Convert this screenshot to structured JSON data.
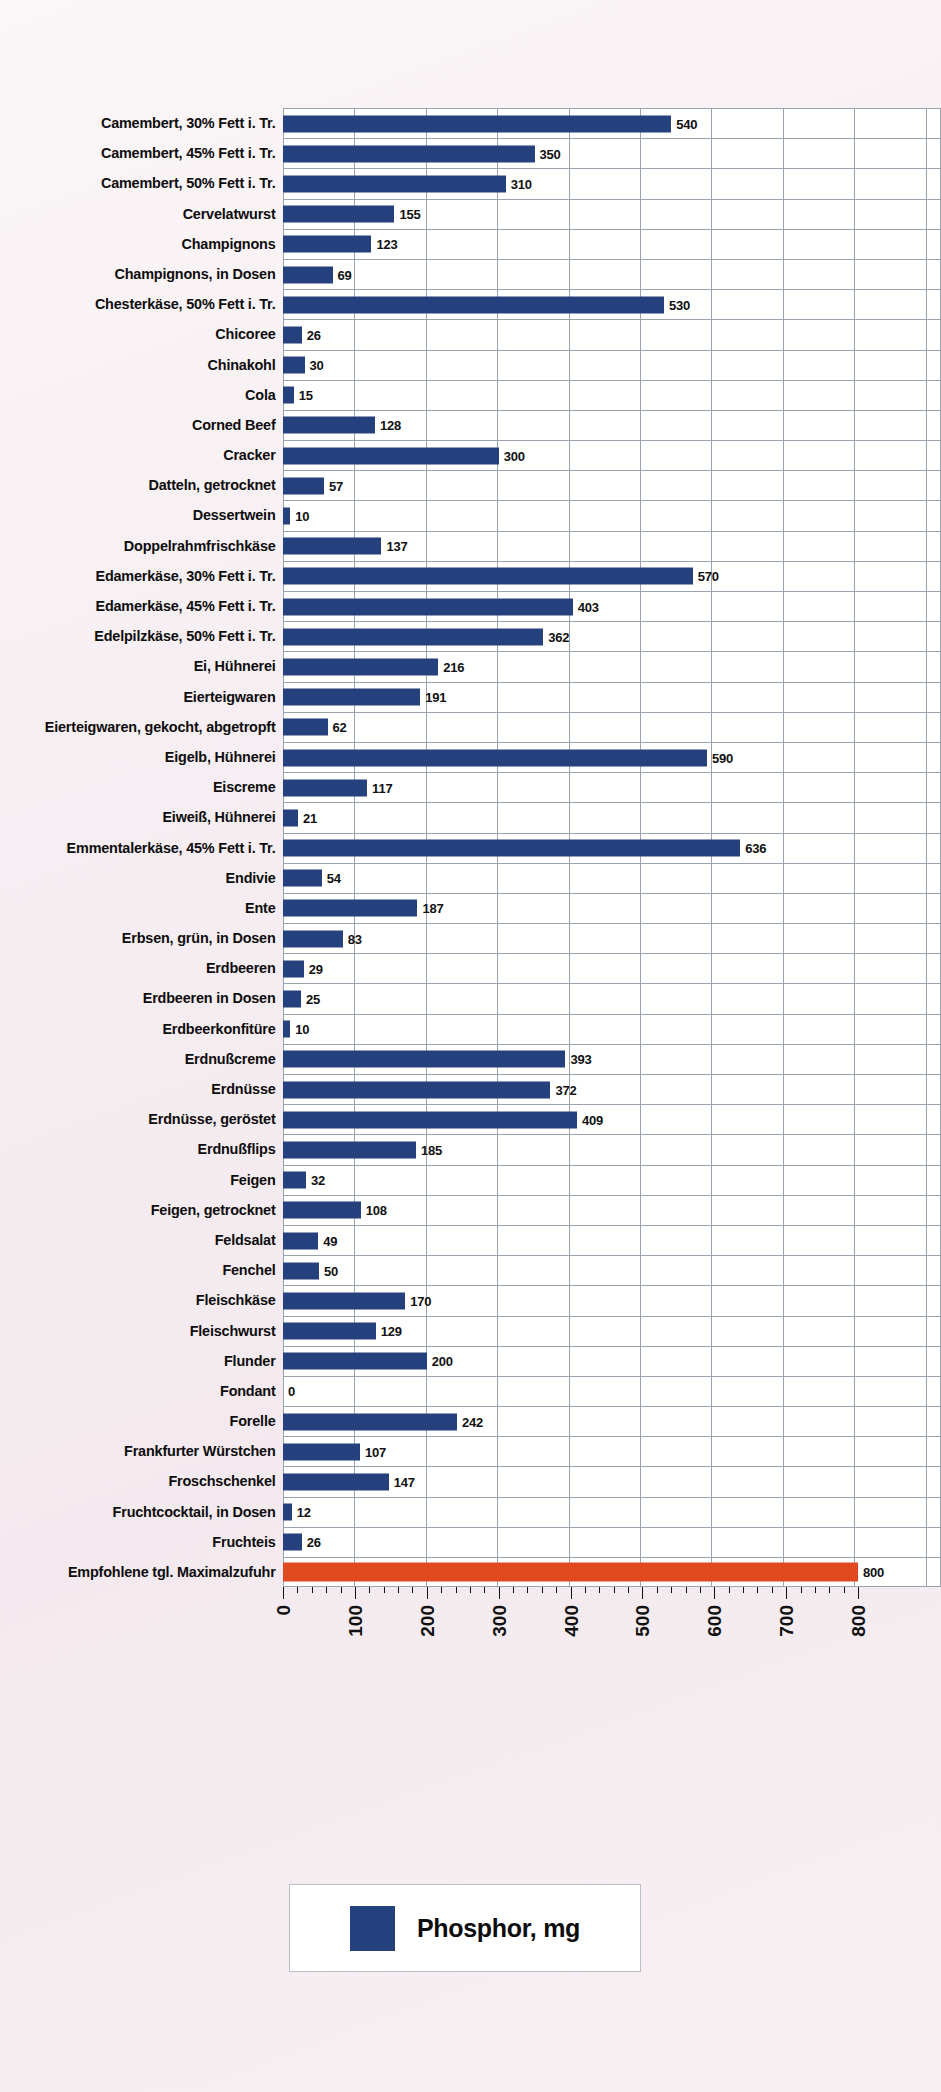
{
  "chart_data": {
    "type": "bar",
    "orientation": "horizontal",
    "title": "",
    "xlabel": "",
    "ylabel": "",
    "xlim": [
      0,
      800
    ],
    "xticks": [
      "0",
      "100",
      "200",
      "300",
      "400",
      "500",
      "600",
      "700",
      "800"
    ],
    "grid": true,
    "legend": {
      "position": "bottom",
      "entries": [
        {
          "label": "Phosphor, mg",
          "color": "#24407d"
        }
      ]
    },
    "colors": {
      "bar": "#24407d",
      "reference_bar": "#e04a20",
      "plot_background": "#ffffff",
      "page_background": "#f6eef2",
      "gridline": "#9aa3ad",
      "text": "#0d0d0d"
    },
    "categories": [
      "Camembert, 30% Fett i. Tr.",
      "Camembert, 45% Fett i. Tr.",
      "Camembert, 50% Fett i. Tr.",
      "Cervelatwurst",
      "Champignons",
      "Champignons, in Dosen",
      "Chesterkäse, 50% Fett i. Tr.",
      "Chicoree",
      "Chinakohl",
      "Cola",
      "Corned Beef",
      "Cracker",
      "Datteln, getrocknet",
      "Dessertwein",
      "Doppelrahmfrischkäse",
      "Edamerkäse, 30% Fett i. Tr.",
      "Edamerkäse, 45% Fett i. Tr.",
      "Edelpilzkäse, 50% Fett i. Tr.",
      "Ei, Hühnerei",
      "Eierteigwaren",
      "Eierteigwaren, gekocht, abgetropft",
      "Eigelb, Hühnerei",
      "Eiscreme",
      "Eiweiß, Hühnerei",
      "Emmentalerkäse, 45% Fett i. Tr.",
      "Endivie",
      "Ente",
      "Erbsen, grün, in Dosen",
      "Erdbeeren",
      "Erdbeeren in Dosen",
      "Erdbeerkonfitüre",
      "Erdnußcreme",
      "Erdnüsse",
      "Erdnüsse, geröstet",
      "Erdnußflips",
      "Feigen",
      "Feigen, getrocknet",
      "Feldsalat",
      "Fenchel",
      "Fleischkäse",
      "Fleischwurst",
      "Flunder",
      "Fondant",
      "Forelle",
      "Frankfurter Würstchen",
      "Froschschenkel",
      "Fruchtcocktail, in Dosen",
      "Fruchteis",
      "Empfohlene tgl. Maximalzufuhr"
    ],
    "values": [
      540,
      350,
      310,
      155,
      123,
      69,
      530,
      26,
      30,
      15,
      128,
      300,
      57,
      10,
      137,
      570,
      403,
      362,
      216,
      191,
      62,
      590,
      117,
      21,
      636,
      54,
      187,
      83,
      29,
      25,
      10,
      393,
      372,
      409,
      185,
      32,
      108,
      49,
      50,
      170,
      129,
      200,
      0,
      242,
      107,
      147,
      12,
      26,
      800
    ],
    "reference_index": 48
  }
}
